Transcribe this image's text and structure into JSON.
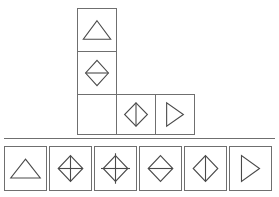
{
  "puzzle": {
    "type": "visual-analogy-matrix",
    "layout": "L-shaped",
    "divider_color": "#6f6f6f",
    "cell_border_color": "#6f6f6f",
    "shape_stroke_color": "#4a4a4a",
    "background_color": "#ffffff",
    "matrix": {
      "name": "matrix-grid",
      "cells": [
        {
          "id": "cell-r1c1",
          "row": 1,
          "col": 1,
          "x": 77,
          "y": 8,
          "width": 40,
          "height": 44,
          "shape": "triangle-up",
          "shape_label": "Triangle pointing up",
          "empty": false
        },
        {
          "id": "cell-r2c1",
          "row": 2,
          "col": 1,
          "x": 77,
          "y": 51,
          "width": 40,
          "height": 44,
          "shape": "diamond-horizontal-line",
          "shape_label": "Diamond with horizontal midline",
          "empty": false
        },
        {
          "id": "cell-r3c1",
          "row": 3,
          "col": 1,
          "x": 77,
          "y": 94,
          "width": 40,
          "height": 41,
          "shape": "none",
          "shape_label": "Empty cell",
          "empty": true
        },
        {
          "id": "cell-r3c2",
          "row": 3,
          "col": 2,
          "x": 116,
          "y": 94,
          "width": 40,
          "height": 41,
          "shape": "diamond-vertical-line",
          "shape_label": "Diamond with vertical midline",
          "empty": false
        },
        {
          "id": "cell-r3c3",
          "row": 3,
          "col": 3,
          "x": 155,
          "y": 94,
          "width": 40,
          "height": 41,
          "shape": "triangle-right",
          "shape_label": "Triangle pointing right",
          "empty": false
        }
      ]
    },
    "options": {
      "name": "answer-options",
      "count": 6,
      "items": [
        {
          "id": "option-1",
          "index": 1,
          "x": 4,
          "shape": "triangle-up",
          "shape_label": "Triangle pointing up"
        },
        {
          "id": "option-2",
          "index": 2,
          "x": 49,
          "shape": "diamond-quadrants",
          "shape_label": "Diamond divided into four quadrants"
        },
        {
          "id": "option-3",
          "index": 3,
          "x": 94,
          "shape": "diamond-cross",
          "shape_label": "Diamond with cross through center"
        },
        {
          "id": "option-4",
          "index": 4,
          "x": 139,
          "shape": "diamond-horizontal-line",
          "shape_label": "Diamond with horizontal midline"
        },
        {
          "id": "option-5",
          "index": 5,
          "x": 184,
          "shape": "diamond-vertical-line",
          "shape_label": "Diamond with vertical midline"
        },
        {
          "id": "option-6",
          "index": 6,
          "x": 229,
          "shape": "triangle-right",
          "shape_label": "Triangle pointing right"
        }
      ]
    }
  }
}
